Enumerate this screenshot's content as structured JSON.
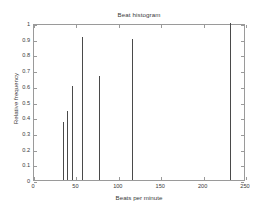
{
  "figure": {
    "background_color": "#ffffff",
    "axis_color": "#9a9a9a",
    "line_color": "#4a4a4a",
    "text_color": "#3a3a3a"
  },
  "chart_data": {
    "type": "bar",
    "title": "Beat histogram",
    "xlabel": "Beats per minute",
    "ylabel": "Relative frequency",
    "xlim": [
      0,
      250
    ],
    "ylim": [
      0,
      1
    ],
    "grid": false,
    "legend": null,
    "xticks": [
      0,
      50,
      100,
      150,
      200,
      250
    ],
    "xtick_labels": [
      "0",
      "50",
      "100",
      "150",
      "200",
      "250"
    ],
    "yticks": [
      0,
      0.1,
      0.2,
      0.3,
      0.4,
      0.5,
      0.6,
      0.7,
      0.8,
      0.9,
      1
    ],
    "ytick_labels": [
      "0",
      "0.1",
      "0.2",
      "0.3",
      "0.4",
      "0.5",
      "0.6",
      "0.7",
      "0.8",
      "0.9",
      "1"
    ],
    "x": [
      34,
      39,
      45,
      57,
      77,
      115,
      231
    ],
    "values": [
      0.37,
      0.44,
      0.6,
      0.91,
      0.66,
      0.9,
      1.0
    ],
    "categories": [
      "34",
      "39",
      "45",
      "57",
      "77",
      "115",
      "231"
    ]
  }
}
